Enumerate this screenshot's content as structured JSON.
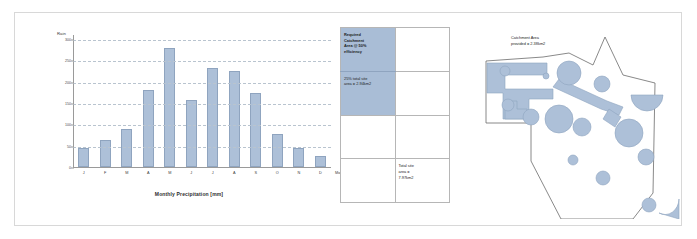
{
  "slide": {
    "title": "Rainwater catchment analysis slide"
  },
  "chart_data": {
    "type": "bar",
    "title": "Monthly Precipitation [mm]",
    "xlabel": "Month",
    "ylabel": "Rain",
    "categories": [
      "J",
      "F",
      "M",
      "A",
      "M",
      "J",
      "J",
      "A",
      "S",
      "O",
      "N",
      "D"
    ],
    "values": [
      44,
      63,
      89,
      181,
      278,
      158,
      232,
      224,
      173,
      78,
      44,
      25
    ],
    "yticks": [
      0,
      50,
      100,
      150,
      200,
      250,
      300
    ],
    "ylim": [
      0,
      300
    ],
    "grid": true,
    "legend": "none",
    "series_color": "#adc0d8"
  },
  "table": {
    "rows": [
      {
        "left": "Required\nCatchment\nArea @ 50%\nefficiency",
        "left_shaded": true,
        "right": "",
        "right_shaded": false
      },
      {
        "left": "25% total site\narea = 2.94km2",
        "left_shaded": true,
        "right": "",
        "right_shaded": false
      },
      {
        "left": "",
        "left_shaded": false,
        "right": "",
        "right_shaded": false
      },
      {
        "left": "",
        "left_shaded": false,
        "right": "Total site\narea =\n7.97km2",
        "right_shaded": false
      }
    ],
    "shade_color": "#a9bdd6"
  },
  "map": {
    "label": "Catchment Area\nprovided = 2.38km2",
    "site_outline_color": "#6b6b6b",
    "catchment_fill": "#adc0d8",
    "catchment_stroke": "#8fa4bf"
  }
}
